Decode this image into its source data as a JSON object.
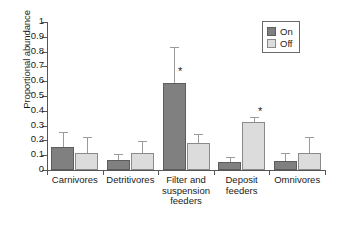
{
  "chart_data": {
    "type": "bar",
    "title": "",
    "xlabel": "",
    "ylabel": "Proportional abundance",
    "ylim": [
      0,
      1
    ],
    "yticks": [
      "0",
      "0.1",
      "0.2",
      "0.3",
      "0.4",
      "0.5",
      "0.6",
      "0.7",
      "0.8",
      "0.9",
      "1"
    ],
    "grid": false,
    "legend_position": "top-right",
    "categories": [
      "Carnivores",
      "Detritivores",
      "Filter and suspension feeders",
      "Deposit feeders",
      "Omnivores"
    ],
    "category_lines": [
      [
        "Carnivores"
      ],
      [
        "Detritivores"
      ],
      [
        "Filter and",
        "suspension",
        "feeders"
      ],
      [
        "Deposit",
        "feeders"
      ],
      [
        "Omnivores"
      ]
    ],
    "series": [
      {
        "name": "On",
        "color": "#808080",
        "values": [
          0.155,
          0.07,
          0.59,
          0.055,
          0.06
        ],
        "errors_upper": [
          0.26,
          0.105,
          0.83,
          0.09,
          0.115
        ],
        "significance": [
          false,
          false,
          true,
          false,
          false
        ]
      },
      {
        "name": "Off",
        "color": "#dcdcdc",
        "values": [
          0.115,
          0.115,
          0.18,
          0.325,
          0.115
        ],
        "errors_upper": [
          0.22,
          0.195,
          0.245,
          0.355,
          0.22
        ],
        "significance": [
          false,
          false,
          false,
          true,
          false
        ]
      }
    ],
    "annotations": [
      {
        "text": "*",
        "series": "On",
        "category": "Filter and suspension feeders",
        "y": 0.67
      },
      {
        "text": "*",
        "series": "Off",
        "category": "Deposit feeders",
        "y": 0.4
      }
    ]
  },
  "legend": {
    "items": [
      {
        "label": "On",
        "color": "#808080"
      },
      {
        "label": "Off",
        "color": "#dcdcdc"
      }
    ]
  },
  "colors": {
    "on": "#808080",
    "off": "#dcdcdc",
    "axis": "#555555",
    "error": "#9a9a9a",
    "background": "#ffffff"
  }
}
